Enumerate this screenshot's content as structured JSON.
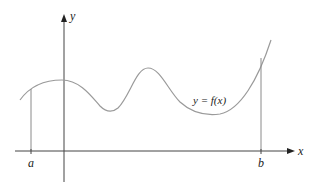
{
  "diagram": {
    "type": "function-graph",
    "axes": {
      "x_label": "x",
      "y_label": "y"
    },
    "curve_label": "y = f(x)",
    "bounds": {
      "left_label": "a",
      "right_label": "b"
    },
    "colors": {
      "axis": "#444444",
      "curve": "#9a9a9a",
      "bound_lines": "#8a8a8a",
      "text": "#222222"
    }
  }
}
